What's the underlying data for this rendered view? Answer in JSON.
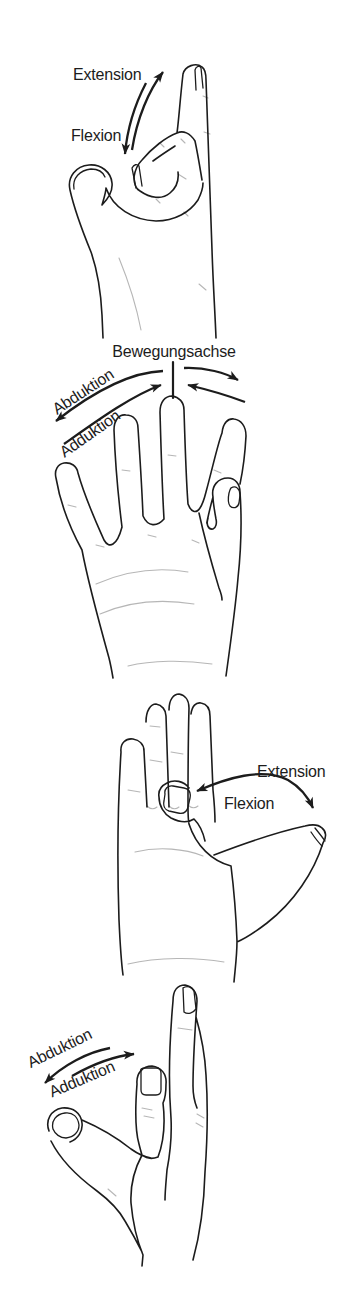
{
  "colors": {
    "ink": "#1c1c1c",
    "paper": "#ffffff"
  },
  "panels": {
    "finger_flexion": {
      "title": "finger flexion and extension",
      "extension": "Extension",
      "flexion": "Flexion"
    },
    "finger_spread": {
      "title": "finger abduction and adduction around movement axis",
      "axis": "Bewegungsachse",
      "abduction": "Abduktion",
      "adduction": "Adduktion"
    },
    "thumb_flexion": {
      "title": "thumb flexion and extension",
      "extension": "Extension",
      "flexion": "Flexion"
    },
    "thumb_spread": {
      "title": "thumb abduction and adduction",
      "abduction": "Abduktion",
      "adduction": "Adduktion"
    }
  }
}
